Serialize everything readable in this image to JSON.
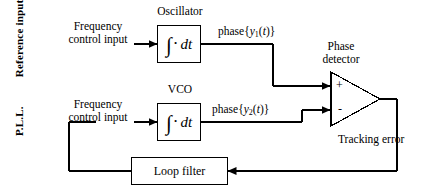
{
  "figure": {
    "type": "block-diagram",
    "background": "#ffffff",
    "line_color": "#000000"
  },
  "side_labels": {
    "reference": "Reference input",
    "pll": "P.L.L."
  },
  "blocks": {
    "oscillator": {
      "title": "Oscillator",
      "symbol_integral": "∫",
      "symbol_dot": "·",
      "symbol_dt": "dt"
    },
    "vco": {
      "title": "VCO",
      "symbol_integral": "∫",
      "symbol_dot": "·",
      "symbol_dt": "dt"
    },
    "phase_detector": {
      "title_line1": "Phase",
      "title_line2": "detector",
      "plus_sign": "+",
      "minus_sign": "-"
    },
    "loop_filter": {
      "title": "Loop filter"
    }
  },
  "inputs": {
    "ref_control_line1": "Frequency",
    "ref_control_line2": "control input",
    "vco_control_line1": "Frequency",
    "vco_control_line2": "control input"
  },
  "signals": {
    "phase1_prefix": "phase{",
    "phase1_var": "y",
    "phase1_sub": "1",
    "phase1_suffix": "(",
    "phase1_t": "t",
    "phase1_close": ")}",
    "phase2_prefix": "phase{",
    "phase2_var": "y",
    "phase2_sub": "2",
    "phase2_suffix": "(",
    "phase2_t": "t",
    "phase2_close": ")}",
    "tracking_error": "Tracking error"
  }
}
